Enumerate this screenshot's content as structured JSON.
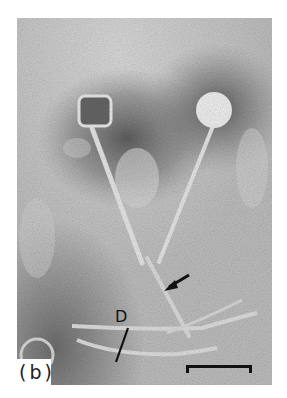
{
  "figure": {
    "panel_label": "(b)",
    "annotations": [
      {
        "type": "letter",
        "text": "D"
      },
      {
        "type": "arrow",
        "text": ""
      }
    ],
    "scale_bar": {
      "present": true,
      "label": ""
    }
  },
  "colors": {
    "background": "#ffffff",
    "micrograph_base": "#b9b9b9",
    "stain_dark": "#6e6e6e",
    "particle_light": "#eeeeee",
    "annotation": "#111111"
  }
}
